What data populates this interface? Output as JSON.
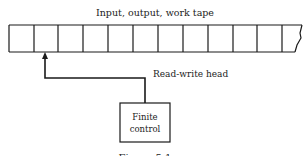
{
  "diagram": {
    "tape_label": "Input, output, work tape",
    "head_label": "Read-write head",
    "control_label_line1": "Finite",
    "control_label_line2": "control",
    "caption": "Figure 5.1",
    "tape_cell_count": 12,
    "head_position_cell": 2,
    "colors": {
      "stroke": "#1a1a1a",
      "background": "#ffffff"
    }
  }
}
